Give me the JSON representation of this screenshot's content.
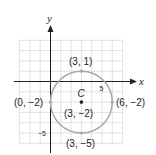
{
  "diagram": {
    "axes": {
      "x_label": "x",
      "y_label": "y",
      "x_tick_label": "5",
      "y_tick_label": "−5"
    },
    "grid": {
      "x_range": [
        -3,
        7
      ],
      "y_range": [
        -6,
        4
      ],
      "step": 1
    },
    "circle": {
      "center": {
        "x": 3,
        "y": -2,
        "name": "C",
        "label": "(3, −2)"
      },
      "radius": 3,
      "points": [
        {
          "x": 3,
          "y": 1,
          "label": "(3, 1)"
        },
        {
          "x": 0,
          "y": -2,
          "label": "(0, −2)"
        },
        {
          "x": 6,
          "y": -2,
          "label": "(6, −2)"
        },
        {
          "x": 3,
          "y": -5,
          "label": "(3, −5)"
        }
      ]
    },
    "colors": {
      "grid": "#d9d9d9",
      "axis": "#231f20",
      "circle": "#a8a8a8",
      "center_dot": "#231f20",
      "text": "#231f20"
    }
  }
}
